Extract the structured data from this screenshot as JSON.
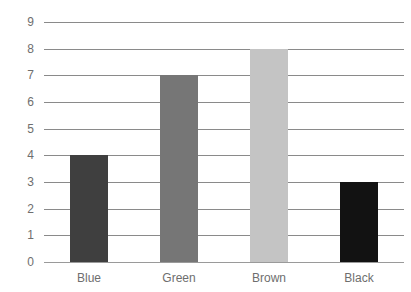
{
  "chart_data": {
    "type": "bar",
    "title": "",
    "xlabel": "",
    "ylabel": "",
    "categories": [
      "Blue",
      "Green",
      "Brown",
      "Black"
    ],
    "values": [
      4,
      7,
      8,
      3
    ],
    "bar_colors": [
      "#3f3f3f",
      "#767676",
      "#c4c4c4",
      "#121212"
    ],
    "ylim": [
      0,
      9
    ],
    "yticks": [
      9,
      8,
      7,
      6,
      5,
      4,
      3,
      2,
      1,
      0
    ],
    "ytick_labels": [
      "9",
      "8",
      "7",
      "6",
      "5",
      "4",
      "3",
      "2",
      "1",
      "0"
    ],
    "grid": true,
    "legend": false,
    "legend_position": "none",
    "gridline_color": "#8a8a8a",
    "axis_text_color": "#6e6e6e",
    "background_color": "#ffffff"
  }
}
